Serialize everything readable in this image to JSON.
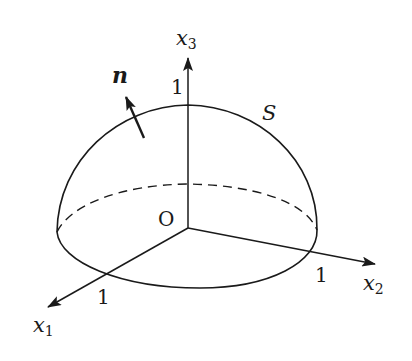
{
  "diagram": {
    "type": "hemisphere-surface-with-normal",
    "axes": {
      "x1": {
        "label": "x",
        "subscript": "1",
        "tick": "1"
      },
      "x2": {
        "label": "x",
        "subscript": "2",
        "tick": "1"
      },
      "x3": {
        "label": "x",
        "subscript": "3",
        "tick": "1"
      }
    },
    "origin_label": "O",
    "surface_label": "S",
    "normal_label": "n",
    "colors": {
      "stroke": "#1a1a1a",
      "background": "#ffffff"
    }
  }
}
